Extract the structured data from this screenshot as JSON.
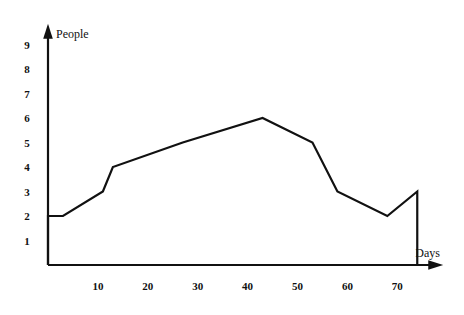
{
  "chart_data": {
    "type": "line",
    "subtype": "step-post",
    "title": "",
    "xlabel": "Days",
    "ylabel": "People",
    "xlim": [
      0,
      78
    ],
    "ylim": [
      0,
      9.6
    ],
    "grid": false,
    "legend": null,
    "x_ticks": [
      10,
      20,
      30,
      40,
      50,
      60,
      70
    ],
    "x_tick_labels": [
      "10",
      "20",
      "30",
      "40",
      "50",
      "60",
      "70"
    ],
    "y_ticks": [
      1,
      2,
      3,
      4,
      5,
      6,
      7,
      8,
      9
    ],
    "y_tick_labels": [
      "1",
      "2",
      "3",
      "4",
      "5",
      "6",
      "7",
      "8",
      "9"
    ],
    "steps": [
      {
        "x_start": 0,
        "x_end": 3,
        "value": 2
      },
      {
        "x_start": 3,
        "x_end": 11,
        "value": 3
      },
      {
        "x_start": 11,
        "x_end": 13,
        "value": 4
      },
      {
        "x_start": 13,
        "x_end": 27,
        "value": 5
      },
      {
        "x_start": 27,
        "x_end": 43,
        "value": 6
      },
      {
        "x_start": 43,
        "x_end": 53,
        "value": 5
      },
      {
        "x_start": 53,
        "x_end": 58,
        "value": 3
      },
      {
        "x_start": 58,
        "x_end": 68,
        "value": 2
      },
      {
        "x_start": 68,
        "x_end": 74,
        "value": 3
      }
    ],
    "colors": {
      "line": "#111111",
      "axis": "#111111",
      "background": "#ffffff",
      "text": "#111111"
    }
  }
}
